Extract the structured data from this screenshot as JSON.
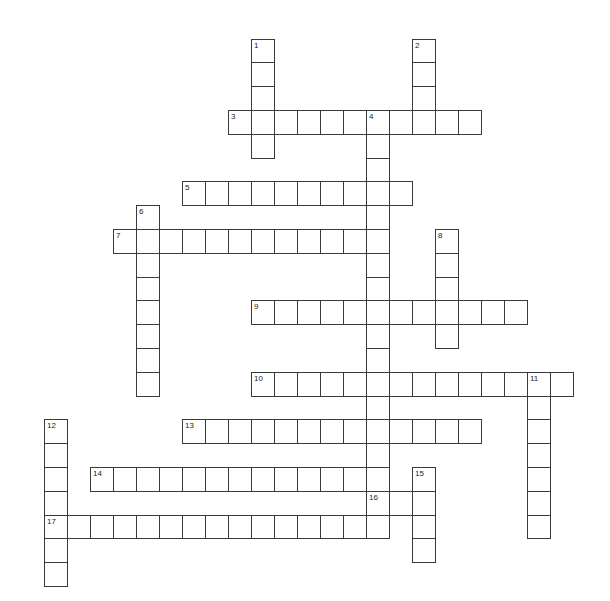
{
  "puzzle": {
    "type": "crossword",
    "cell_width": 23,
    "cell_height": 23.8,
    "origin_x": 21,
    "origin_y": 38.6,
    "line_color": "#3a3a3a",
    "background": "#ffffff",
    "words": [
      {
        "number": "1",
        "direction": "down",
        "col": 10,
        "row": 0,
        "length": 5
      },
      {
        "number": "2",
        "direction": "down",
        "col": 17,
        "row": 0,
        "length": 4
      },
      {
        "number": "3",
        "direction": "across",
        "col": 9,
        "row": 3,
        "length": 11
      },
      {
        "number": "4",
        "direction": "down",
        "col": 15,
        "row": 3,
        "length": 18
      },
      {
        "number": "5",
        "direction": "across",
        "col": 7,
        "row": 6,
        "length": 10
      },
      {
        "number": "6",
        "direction": "down",
        "col": 5,
        "row": 7,
        "length": 8
      },
      {
        "number": "7",
        "direction": "across",
        "col": 4,
        "row": 8,
        "length": 12
      },
      {
        "number": "8",
        "direction": "down",
        "col": 18,
        "row": 8,
        "length": 5
      },
      {
        "number": "9",
        "direction": "across",
        "col": 10,
        "row": 11,
        "length": 12
      },
      {
        "number": "10",
        "direction": "across",
        "col": 10,
        "row": 14,
        "length": 14
      },
      {
        "number": "11",
        "direction": "down",
        "col": 22,
        "row": 14,
        "length": 7
      },
      {
        "number": "12",
        "direction": "down",
        "col": 1,
        "row": 16,
        "length": 7
      },
      {
        "number": "13",
        "direction": "across",
        "col": 7,
        "row": 16,
        "length": 13
      },
      {
        "number": "14",
        "direction": "across",
        "col": 3,
        "row": 18,
        "length": 13
      },
      {
        "number": "15",
        "direction": "down",
        "col": 17,
        "row": 18,
        "length": 4
      },
      {
        "number": "16",
        "direction": "across",
        "col": 15,
        "row": 19,
        "length": 3
      },
      {
        "number": "17",
        "direction": "across",
        "col": 1,
        "row": 20,
        "length": 15
      }
    ]
  }
}
